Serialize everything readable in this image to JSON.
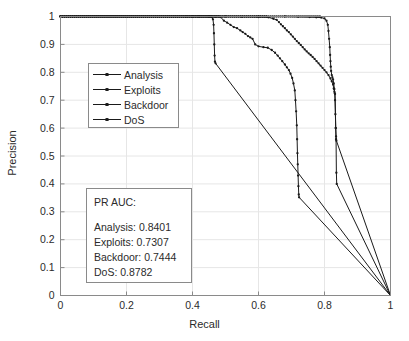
{
  "chart_data": {
    "type": "line",
    "title": "",
    "xlabel": "Recall",
    "ylabel": "Precision",
    "xlim": [
      0,
      1
    ],
    "ylim": [
      0,
      1
    ],
    "xticks": [
      "0",
      "0.2",
      "0.4",
      "0.6",
      "0.8",
      "1"
    ],
    "xtick_values": [
      0,
      0.2,
      0.4,
      0.6,
      0.8,
      1
    ],
    "yticks": [
      "0",
      "0.1",
      "0.2",
      "0.3",
      "0.4",
      "0.5",
      "0.6",
      "0.7",
      "0.8",
      "0.9",
      "1"
    ],
    "ytick_values": [
      0,
      0.1,
      0.2,
      0.3,
      0.4,
      0.5,
      0.6,
      0.7,
      0.8,
      0.9,
      1
    ],
    "grid": true,
    "legend_position": "upper-left-inset",
    "line_color": "#1a1a1a",
    "grid_color": "#e6e6e6",
    "axis_color": "#8a8a8a",
    "series": [
      {
        "name": "Analysis",
        "points": [
          [
            0.0,
            1.0
          ],
          [
            0.1,
            1.0
          ],
          [
            0.2,
            1.0
          ],
          [
            0.3,
            1.0
          ],
          [
            0.38,
            1.0
          ],
          [
            0.42,
            1.0
          ],
          [
            0.45,
            1.0
          ],
          [
            0.458,
            0.998
          ],
          [
            0.462,
            0.99
          ],
          [
            0.464,
            0.97
          ],
          [
            0.465,
            0.94
          ],
          [
            0.466,
            0.9
          ],
          [
            0.467,
            0.86
          ],
          [
            0.468,
            0.838
          ],
          [
            0.47,
            0.832
          ],
          [
            1.0,
            0.0
          ]
        ]
      },
      {
        "name": "Exploits",
        "points": [
          [
            0.0,
            1.0
          ],
          [
            0.15,
            1.0
          ],
          [
            0.3,
            1.0
          ],
          [
            0.42,
            1.0
          ],
          [
            0.47,
            0.999
          ],
          [
            0.485,
            0.998
          ],
          [
            0.495,
            0.985
          ],
          [
            0.505,
            0.978
          ],
          [
            0.515,
            0.97
          ],
          [
            0.525,
            0.962
          ],
          [
            0.535,
            0.958
          ],
          [
            0.545,
            0.95
          ],
          [
            0.552,
            0.944
          ],
          [
            0.56,
            0.938
          ],
          [
            0.568,
            0.93
          ],
          [
            0.575,
            0.925
          ],
          [
            0.582,
            0.92
          ],
          [
            0.59,
            0.9
          ],
          [
            0.6,
            0.893
          ],
          [
            0.615,
            0.89
          ],
          [
            0.628,
            0.888
          ],
          [
            0.64,
            0.88
          ],
          [
            0.65,
            0.87
          ],
          [
            0.658,
            0.86
          ],
          [
            0.665,
            0.85
          ],
          [
            0.672,
            0.84
          ],
          [
            0.68,
            0.828
          ],
          [
            0.686,
            0.818
          ],
          [
            0.692,
            0.808
          ],
          [
            0.697,
            0.795
          ],
          [
            0.702,
            0.78
          ],
          [
            0.706,
            0.76
          ],
          [
            0.71,
            0.735
          ],
          [
            0.712,
            0.7
          ],
          [
            0.714,
            0.66
          ],
          [
            0.716,
            0.61
          ],
          [
            0.717,
            0.56
          ],
          [
            0.718,
            0.51
          ],
          [
            0.719,
            0.47
          ],
          [
            0.72,
            0.43
          ],
          [
            0.721,
            0.392
          ],
          [
            0.722,
            0.362
          ],
          [
            0.723,
            0.352
          ],
          [
            1.0,
            0.0
          ]
        ]
      },
      {
        "name": "Backdoor",
        "points": [
          [
            0.0,
            1.0
          ],
          [
            0.2,
            1.0
          ],
          [
            0.4,
            1.0
          ],
          [
            0.5,
            1.0
          ],
          [
            0.55,
            0.999
          ],
          [
            0.6,
            0.998
          ],
          [
            0.63,
            0.997
          ],
          [
            0.645,
            0.992
          ],
          [
            0.655,
            0.988
          ],
          [
            0.662,
            0.98
          ],
          [
            0.668,
            0.972
          ],
          [
            0.674,
            0.965
          ],
          [
            0.68,
            0.958
          ],
          [
            0.686,
            0.95
          ],
          [
            0.692,
            0.944
          ],
          [
            0.698,
            0.936
          ],
          [
            0.704,
            0.928
          ],
          [
            0.71,
            0.92
          ],
          [
            0.716,
            0.912
          ],
          [
            0.722,
            0.905
          ],
          [
            0.728,
            0.898
          ],
          [
            0.734,
            0.89
          ],
          [
            0.74,
            0.882
          ],
          [
            0.746,
            0.875
          ],
          [
            0.752,
            0.868
          ],
          [
            0.758,
            0.862
          ],
          [
            0.764,
            0.855
          ],
          [
            0.77,
            0.848
          ],
          [
            0.776,
            0.84
          ],
          [
            0.782,
            0.832
          ],
          [
            0.788,
            0.824
          ],
          [
            0.794,
            0.816
          ],
          [
            0.8,
            0.808
          ],
          [
            0.806,
            0.8
          ],
          [
            0.812,
            0.79
          ],
          [
            0.818,
            0.778
          ],
          [
            0.822,
            0.768
          ],
          [
            0.826,
            0.756
          ],
          [
            0.828,
            0.742
          ],
          [
            0.83,
            0.73
          ],
          [
            0.832,
            0.722
          ],
          [
            0.834,
            0.6
          ],
          [
            0.835,
            0.56
          ],
          [
            0.836,
            0.44
          ],
          [
            0.837,
            0.4
          ],
          [
            1.0,
            0.0
          ]
        ]
      },
      {
        "name": "DoS",
        "points": [
          [
            0.0,
            1.0
          ],
          [
            0.25,
            1.0
          ],
          [
            0.45,
            1.0
          ],
          [
            0.6,
            1.0
          ],
          [
            0.68,
            1.0
          ],
          [
            0.72,
            0.999
          ],
          [
            0.755,
            0.998
          ],
          [
            0.775,
            0.997
          ],
          [
            0.79,
            0.996
          ],
          [
            0.8,
            0.993
          ],
          [
            0.806,
            0.985
          ],
          [
            0.81,
            0.97
          ],
          [
            0.812,
            0.948
          ],
          [
            0.814,
            0.92
          ],
          [
            0.816,
            0.89
          ],
          [
            0.817,
            0.862
          ],
          [
            0.818,
            0.84
          ],
          [
            0.819,
            0.82
          ],
          [
            0.82,
            0.805
          ],
          [
            0.822,
            0.79
          ],
          [
            0.824,
            0.782
          ],
          [
            0.826,
            0.775
          ],
          [
            0.828,
            0.76
          ],
          [
            0.83,
            0.74
          ],
          [
            0.831,
            0.725
          ],
          [
            0.832,
            0.7
          ],
          [
            0.833,
            0.65
          ],
          [
            0.834,
            0.6
          ],
          [
            0.835,
            0.57
          ],
          [
            0.836,
            0.555
          ],
          [
            1.0,
            0.0
          ]
        ]
      }
    ],
    "annotations": {
      "auc_title": "PR AUC:",
      "auc_values": [
        {
          "label": "Analysis: 0.8401",
          "name": "Analysis",
          "value": 0.8401
        },
        {
          "label": "Exploits: 0.7307",
          "name": "Exploits",
          "value": 0.7307
        },
        {
          "label": "Backdoor: 0.7444",
          "name": "Backdoor",
          "value": 0.7444
        },
        {
          "label": "DoS: 0.8782",
          "name": "DoS",
          "value": 0.8782
        }
      ]
    }
  },
  "legend": {
    "entries": [
      {
        "label": "Analysis"
      },
      {
        "label": "Exploits"
      },
      {
        "label": "Backdoor"
      },
      {
        "label": "DoS"
      }
    ]
  }
}
